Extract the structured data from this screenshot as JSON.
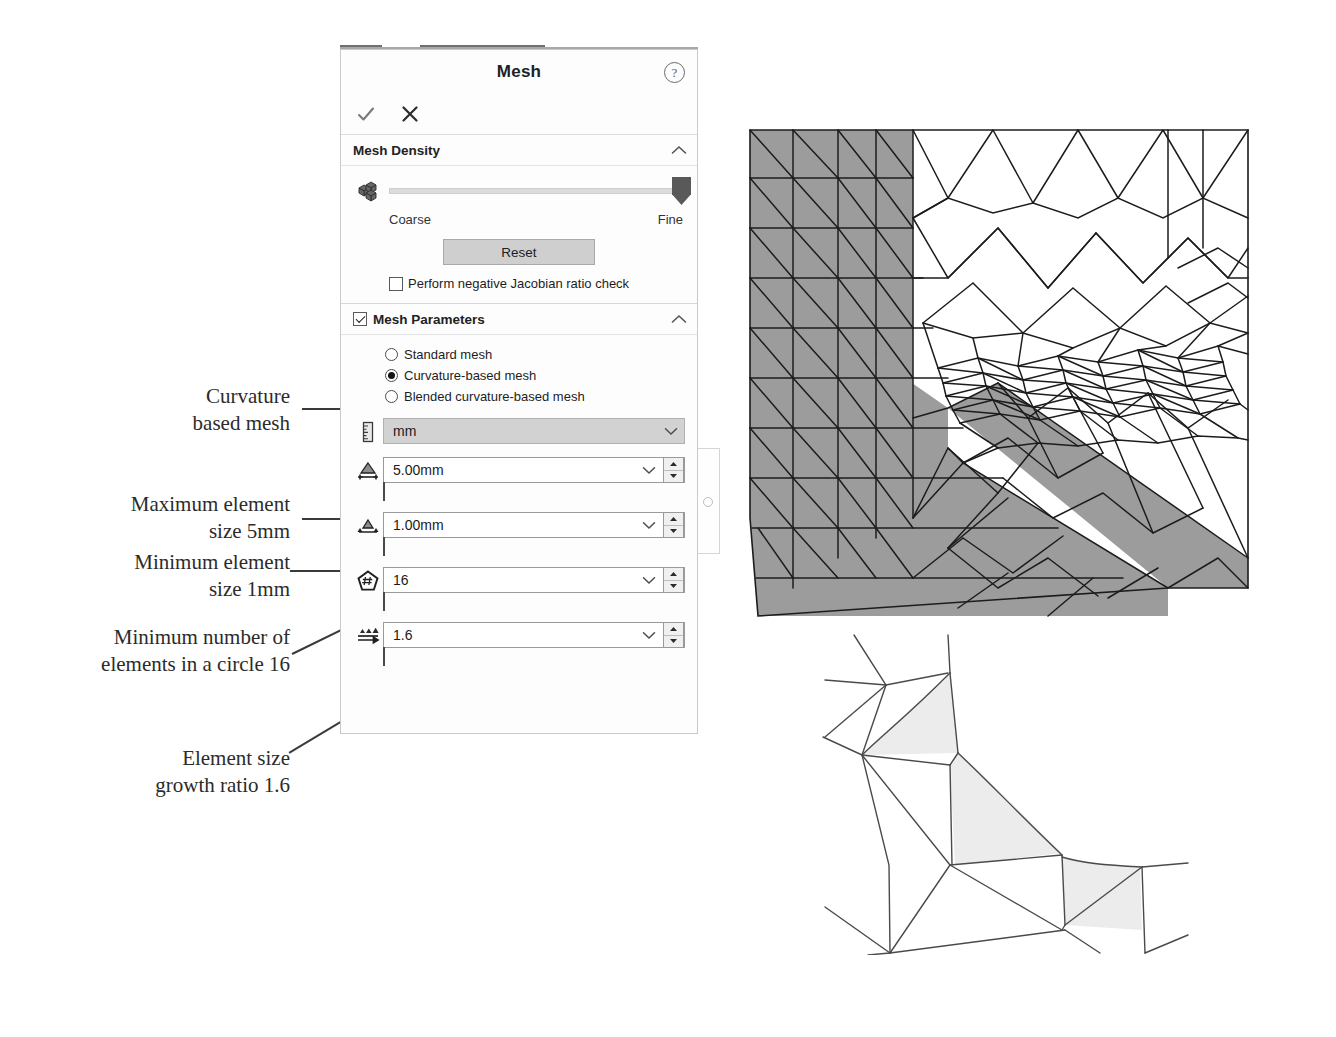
{
  "panel": {
    "title": "Mesh",
    "help_icon": "help-icon",
    "accept_icon": "checkmark-icon",
    "cancel_icon": "close-icon",
    "accent_color": "#595959",
    "sections": {
      "mesh_density": {
        "header": "Mesh Density",
        "collapse_icon": "chevron-up-icon",
        "density_icon": "mesh-cubes-icon",
        "slider": {
          "min_label": "Coarse",
          "max_label": "Fine",
          "value_percent": 100
        },
        "reset_label": "Reset",
        "jacobian_checkbox": {
          "label": "Perform negative Jacobian ratio check",
          "checked": false
        }
      },
      "mesh_parameters": {
        "header": "Mesh Parameters",
        "header_checked": true,
        "collapse_icon": "chevron-up-icon",
        "radios": [
          {
            "label": "Standard mesh",
            "selected": false
          },
          {
            "label": "Curvature-based mesh",
            "selected": true
          },
          {
            "label": "Blended curvature-based mesh",
            "selected": false
          }
        ],
        "fields": [
          {
            "icon": "ruler-icon",
            "value": "mm",
            "kind": "unit",
            "has_spinner": false,
            "has_ruler": false
          },
          {
            "icon": "max-element-size-icon",
            "value": "5.00mm",
            "kind": "number",
            "has_spinner": true,
            "has_ruler": true
          },
          {
            "icon": "min-element-size-icon",
            "value": "1.00mm",
            "kind": "number",
            "has_spinner": true,
            "has_ruler": true
          },
          {
            "icon": "elements-in-circle-icon",
            "value": "16",
            "kind": "number",
            "has_spinner": true,
            "has_ruler": true
          },
          {
            "icon": "growth-ratio-icon",
            "value": "1.6",
            "kind": "number",
            "has_spinner": true,
            "has_ruler": true
          }
        ],
        "caret_icon": "chevron-down-icon",
        "spinner_up_icon": "triangle-up-icon",
        "spinner_down_icon": "triangle-down-icon"
      }
    },
    "side_tab_icon": "panel-pin-icon"
  },
  "annotations": [
    {
      "text": "Curvature\nbased mesh"
    },
    {
      "text": "Maximum element\nsize 5mm"
    },
    {
      "text": "Minimum element\nsize 1mm"
    },
    {
      "text": "Minimum number of\nelements in a circle 16"
    },
    {
      "text": "Element size\ngrowth ratio 1.6"
    }
  ],
  "figures": {
    "top": {
      "name": "fea-mesh-3d-view",
      "shade_color": "#9c9c9c",
      "line_color": "#1c1c1c"
    },
    "bottom": {
      "name": "fea-mesh-closeup-view",
      "shade_color": "#e8e8e8",
      "line_color": "#4a4a4a"
    }
  }
}
